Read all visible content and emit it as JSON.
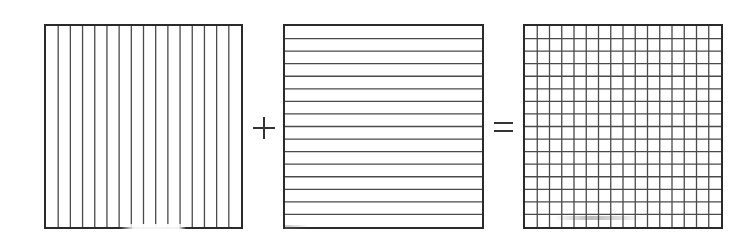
{
  "diagram": {
    "title": "",
    "panels": [
      {
        "id": "vertical-lines",
        "description": "Square with vertical lines",
        "columns": 16,
        "rows": 1
      },
      {
        "id": "horizontal-lines",
        "description": "Square with horizontal lines",
        "columns": 1,
        "rows": 16
      },
      {
        "id": "grid",
        "description": "Square grid (vertical + horizontal)",
        "columns": 16,
        "rows": 16
      }
    ],
    "operators": {
      "plus": "+",
      "equals": "="
    },
    "colors": {
      "border": "#2a2a2a",
      "line": "#4a4a4a",
      "background": "#ffffff"
    }
  }
}
